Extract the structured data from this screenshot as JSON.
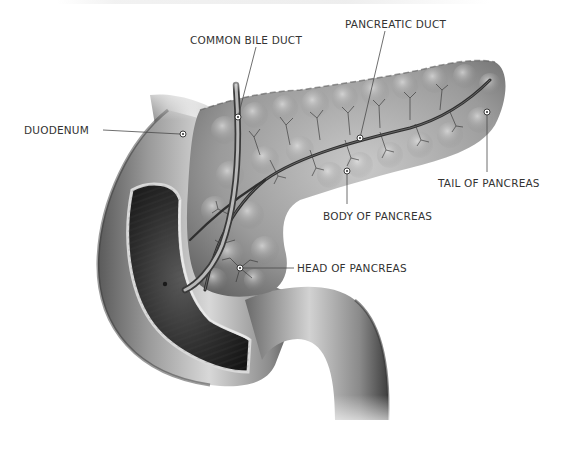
{
  "diagram": {
    "colors": {
      "background": "#ffffff",
      "label_text": "#333333",
      "leader_line": "#4a4a4a",
      "organ_dark": "#3a3a3a",
      "organ_mid": "#8a8a8a",
      "organ_light": "#d6d6d6",
      "lumen": "#1e1e1e",
      "duct": "#3c3c3c"
    },
    "labels": [
      {
        "id": "common-bile-duct",
        "text": "COMMON BILE DUCT",
        "x": 190,
        "y": 34,
        "anchor": [
          238,
          117
        ],
        "line_from": [
          256,
          47
        ]
      },
      {
        "id": "pancreatic-duct",
        "text": "PANCREATIC DUCT",
        "x": 345,
        "y": 18,
        "anchor": [
          360,
          138
        ],
        "line_from": [
          385,
          31
        ]
      },
      {
        "id": "duodenum",
        "text": "DUODENUM",
        "x": 24,
        "y": 124,
        "anchor": [
          183,
          134
        ],
        "line_from": [
          103,
          130
        ]
      },
      {
        "id": "tail-of-pancreas",
        "text": "TAIL OF PANCREAS",
        "x": 438,
        "y": 177,
        "anchor": [
          487,
          112
        ],
        "line_from": [
          487,
          172
        ]
      },
      {
        "id": "body-of-pancreas",
        "text": "BODY OF PANCREAS",
        "x": 323,
        "y": 210,
        "anchor": [
          347,
          171
        ],
        "line_from": [
          347,
          204
        ]
      },
      {
        "id": "head-of-pancreas",
        "text": "HEAD OF PANCREAS",
        "x": 297,
        "y": 262,
        "anchor": [
          240,
          268
        ],
        "line_from": [
          294,
          268
        ]
      }
    ]
  }
}
